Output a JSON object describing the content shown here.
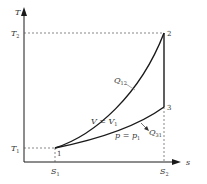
{
  "diagram": {
    "type": "T-S diagram",
    "axes": {
      "y_label": "T",
      "x_label": "s"
    },
    "ticks": {
      "T2": {
        "base": "T",
        "sub": "2"
      },
      "T1": {
        "base": "T",
        "sub": "1"
      },
      "S1": {
        "base": "S",
        "sub": "1"
      },
      "S2": {
        "base": "S",
        "sub": "2"
      }
    },
    "points": [
      {
        "id": "1",
        "label": "1"
      },
      {
        "id": "2",
        "label": "2"
      },
      {
        "id": "3",
        "label": "3"
      }
    ],
    "curves": {
      "constant_volume": {
        "label_base": "V = V",
        "label_sub": "1"
      },
      "constant_pressure": {
        "label_base": "p = p",
        "label_sub": "1"
      }
    },
    "heat": {
      "q12": {
        "base": "Q",
        "sub": "12"
      },
      "q31": {
        "base": "Q",
        "sub": "31"
      }
    },
    "colors": {
      "line": "#1a1a1a",
      "dashed": "#555555",
      "text": "#333333"
    }
  }
}
